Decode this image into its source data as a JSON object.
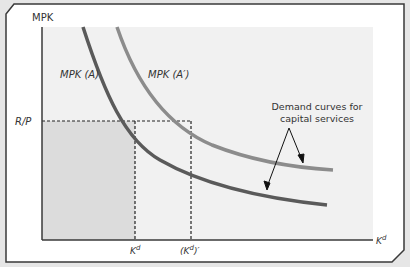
{
  "figure": {
    "y_axis_label": "MPK",
    "x_axis_label": "K",
    "x_axis_label_sup": "d",
    "price_label": "R/P",
    "tick_kd": "K",
    "tick_kd_sup": "d",
    "tick_kd_prime_open": "(K",
    "tick_kd_prime_sup": "d",
    "tick_kd_prime_close": ")′",
    "curves": [
      {
        "name": "MPK (A)",
        "color": "#5a5a5a"
      },
      {
        "name": "MPK (A′)",
        "color": "#8c8c8c"
      }
    ],
    "annotation_line1": "Demand curves for",
    "annotation_line2": "capital services",
    "colors": {
      "page_bg": "#e6e6e6",
      "card_bg": "#ffffff",
      "plot_bg": "#f1f1f1",
      "shaded_region": "#dcdcdc",
      "axis": "#3a3a3a"
    }
  }
}
